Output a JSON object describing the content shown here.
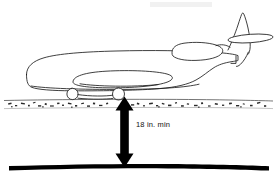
{
  "diagram": {
    "background_color": "#ffffff",
    "ink_color": "#1d1d1d",
    "dimension": {
      "label": "18 in. min",
      "value": 18,
      "unit": "in.",
      "qualifier": "min",
      "orientation": "vertical",
      "arrow_style": "double-headed",
      "from": "ground-surface",
      "to": "buried-line"
    },
    "elements": {
      "aircraft_name": "airplane-side-view",
      "ground_name": "gravel-ground-surface",
      "buried_name": "buried-utility-line",
      "arrow_name": "dimension-arrow",
      "nose_gear_name": "nose-landing-gear-wheel",
      "main_gear_name": "main-landing-gear-wheel",
      "wing_name": "wing-edge-on",
      "engine_name": "rear-mounted-engine-nacelle",
      "vstab_name": "vertical-stabilizer",
      "hstab_name": "horizontal-stabilizer",
      "fuselage_name": "fuselage-outline"
    }
  }
}
